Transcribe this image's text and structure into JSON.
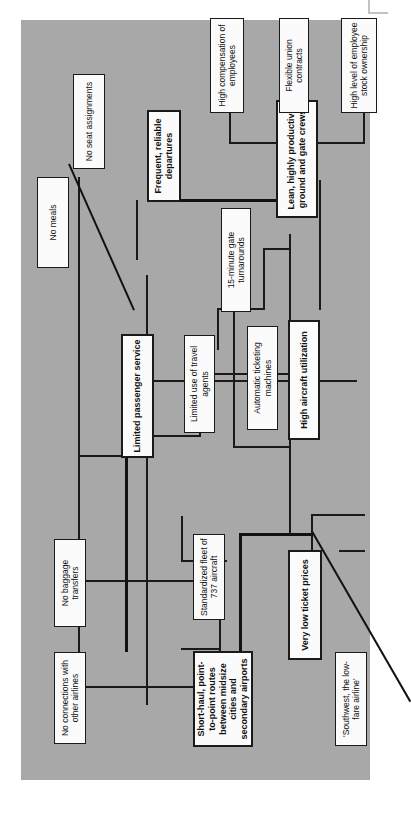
{
  "diagram": {
    "type": "activity-system-map",
    "orientation": "rotated-90-counterclockwise",
    "panel_color": "#a8a8a8",
    "node_fill": "#fbfbfb",
    "line_color": "#1a1a1a",
    "nodes": [
      {
        "id": "no-connections",
        "label": "No connections with other airlines",
        "key": false
      },
      {
        "id": "short-haul",
        "label": "Short-haul, point-to-point routes between midsize cities and secondary airports",
        "key": true
      },
      {
        "id": "southwest",
        "label": "'Southwest, the low-fare airline'",
        "key": false
      },
      {
        "id": "no-baggage",
        "label": "No baggage transfers",
        "key": false
      },
      {
        "id": "standardized-fleet",
        "label": "Standardized fleet of 737 aircraft",
        "key": false
      },
      {
        "id": "very-low-prices",
        "label": "Very low ticket prices",
        "key": true
      },
      {
        "id": "limited-passenger",
        "label": "Limited passenger service",
        "key": true
      },
      {
        "id": "limited-travel",
        "label": "Limited use of travel agents",
        "key": false
      },
      {
        "id": "auto-ticketing",
        "label": "Automatic ticketing machines",
        "key": false
      },
      {
        "id": "high-aircraft",
        "label": "High aircraft utilization",
        "key": true
      },
      {
        "id": "no-meals",
        "label": "No meals",
        "key": false
      },
      {
        "id": "fifteen-minute",
        "label": "15-minute gate turnarounds",
        "key": false
      },
      {
        "id": "frequent-departures",
        "label": "Frequent, reliable departures",
        "key": true
      },
      {
        "id": "lean-crews",
        "label": "Lean, highly productive ground and gate crews",
        "key": true
      },
      {
        "id": "no-seat",
        "label": "No seat assignments",
        "key": false
      },
      {
        "id": "high-compensation",
        "label": "High compensation of employees",
        "key": false
      },
      {
        "id": "flexible-union",
        "label": "Flexible union contracts",
        "key": false
      },
      {
        "id": "stock-ownership",
        "label": "High level of employee stock ownership",
        "key": false
      }
    ]
  }
}
